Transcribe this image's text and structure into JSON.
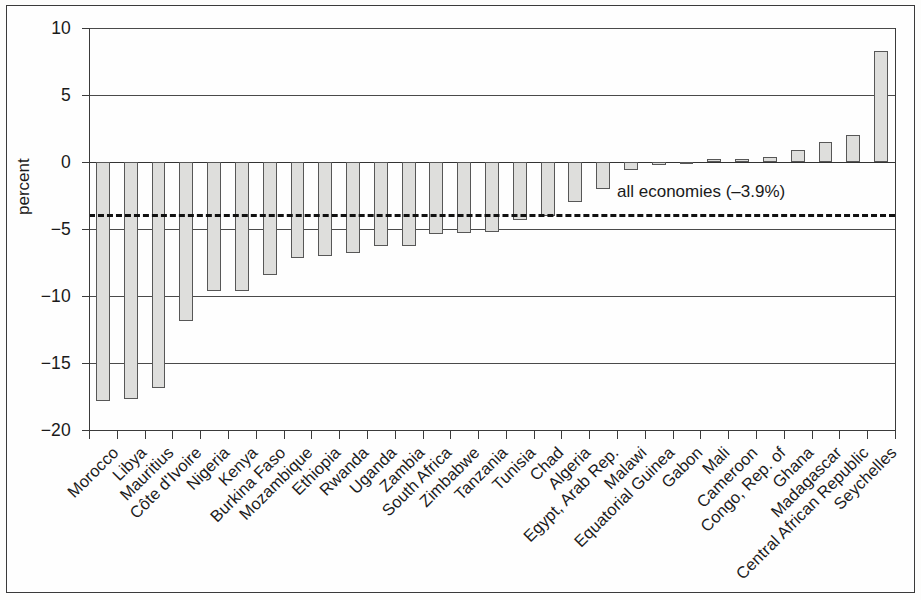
{
  "chart_data": {
    "type": "bar",
    "title": "",
    "subtitle": "",
    "xlabel": "",
    "ylabel": "percent",
    "ylim": [
      -20,
      10
    ],
    "ytick_values": [
      10,
      5,
      0,
      -5,
      -10,
      -15,
      -20
    ],
    "ytick_labels": [
      "10",
      "5",
      "0",
      "−5",
      "−10",
      "−15",
      "−20"
    ],
    "grid": true,
    "grid_axis": "y",
    "legend": "none",
    "bar_fill": "#dededc",
    "bar_edge": "#575757",
    "categories": [
      "Morocco",
      "Libya",
      "Mauritius",
      "Côte d'Ivoire",
      "Nigeria",
      "Kenya",
      "Burkina Faso",
      "Mozambique",
      "Ethiopia",
      "Rwanda",
      "Uganda",
      "Zambia",
      "South Africa",
      "Zimbabwe",
      "Tanzania",
      "Tunisia",
      "Chad",
      "Algeria",
      "Egypt, Arab Rep.",
      "Malawi",
      "Equatorial Guinea",
      "Gabon",
      "Mali",
      "Cameroon",
      "Congo, Rep. of",
      "Ghana",
      "Madagascar",
      "Central African Republic",
      "Seychelles"
    ],
    "values": [
      -17.8,
      -17.7,
      -16.9,
      -11.9,
      -9.6,
      -9.6,
      -8.4,
      -7.2,
      -7.0,
      -6.8,
      -6.3,
      -6.3,
      -5.4,
      -5.3,
      -5.2,
      -4.3,
      -4.0,
      -3.0,
      -2.0,
      -0.6,
      -0.2,
      -0.1,
      0.2,
      0.2,
      0.4,
      0.9,
      1.5,
      2.0,
      8.3
    ],
    "annotations": [
      {
        "name": "all-economies-reference",
        "text": "all economies (–3.9%)",
        "value": -3.9,
        "style": "dashed-horizontal-line"
      }
    ]
  }
}
